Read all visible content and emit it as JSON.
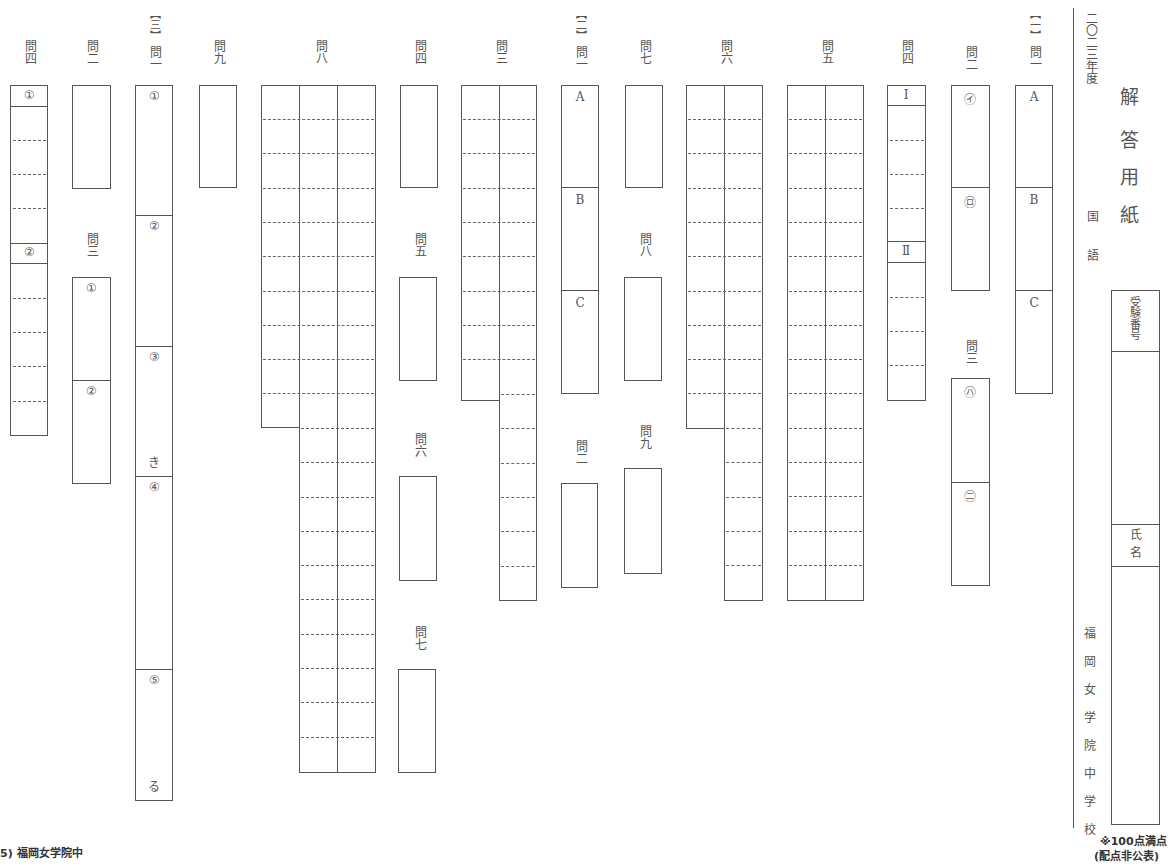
{
  "header": {
    "year": "二〇二三年度",
    "title_chars": [
      "解",
      "答",
      "用",
      "紙"
    ],
    "subject": [
      "国",
      "語"
    ],
    "school": [
      "福",
      "岡",
      "女",
      "学",
      "院",
      "中",
      "学",
      "校"
    ],
    "exam_number_label": "受験番号",
    "name_label": "氏名",
    "score_note_1": "※100点満点",
    "score_note_2": "(配点非公表)"
  },
  "footer": {
    "source": "5) 福岡女学院中"
  },
  "sections": {
    "s1": {
      "bracket": "【一】",
      "q1": {
        "label": "問一",
        "parts": [
          "A",
          "B",
          "C"
        ]
      },
      "q2": {
        "label": "問二",
        "parts": [
          "㋑",
          "㋺"
        ]
      },
      "q3": {
        "label": "問三",
        "parts": [
          "㋩",
          "㊁"
        ]
      },
      "q4": {
        "label": "問四",
        "parts": [
          "Ⅰ",
          "Ⅱ"
        ]
      },
      "q5": {
        "label": "問五"
      },
      "q6": {
        "label": "問六"
      },
      "q7": {
        "label": "問七"
      },
      "q8": {
        "label": "問八"
      },
      "q9": {
        "label": "問九"
      }
    },
    "s2": {
      "bracket": "【二】",
      "q1": {
        "label": "問一",
        "parts": [
          "A",
          "B",
          "C"
        ]
      },
      "q2": {
        "label": "問二"
      },
      "q3": {
        "label": "問三"
      },
      "q4": {
        "label": "問四"
      },
      "q5": {
        "label": "問五"
      },
      "q6": {
        "label": "問六"
      },
      "q7": {
        "label": "問七"
      },
      "q8": {
        "label": "問八"
      },
      "q9": {
        "label": "問九"
      }
    },
    "s3": {
      "bracket": "【三】",
      "q1": {
        "label": "問一",
        "parts": [
          "①",
          "②",
          "③",
          "④",
          "⑤"
        ],
        "suffixes": [
          "き",
          "る"
        ]
      },
      "q2": {
        "label": "問二"
      },
      "q3": {
        "label": "問三",
        "parts": [
          "①",
          "②"
        ]
      },
      "q4": {
        "label": "問四",
        "parts": [
          "①",
          "②"
        ]
      }
    }
  }
}
